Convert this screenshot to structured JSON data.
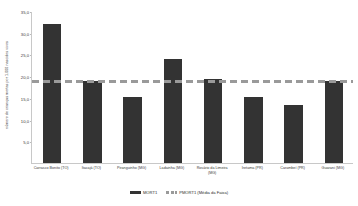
{
  "chart_data": {
    "type": "bar",
    "title": "",
    "xlabel": "",
    "ylabel": "número de crianças mortas por 1.000 nascidos vivos",
    "ylim": [
      0,
      35
    ],
    "yticks": [
      "5,0",
      "10,0",
      "15,0",
      "20,0",
      "25,0",
      "30,0",
      "35,0"
    ],
    "ytick_values": [
      5,
      10,
      15,
      20,
      25,
      30,
      35
    ],
    "grid": false,
    "legend_position": "bottom",
    "categories": [
      "Carrasco Bonito (TO)",
      "Itacajá (TO)",
      "Piranguinho (MG)",
      "Ladainha (MG)",
      "Rosário da Limeira (MG)",
      "Iretama (PR)",
      "Carambeí (PR)",
      "Guarani (MG)"
    ],
    "series": [
      {
        "name": "MORT1",
        "type": "bar",
        "color": "#333333",
        "values": [
          32.0,
          19.0,
          15.2,
          24.0,
          19.3,
          15.2,
          13.3,
          18.8
        ]
      },
      {
        "name": "PMORT1 (Média da Faixa)",
        "type": "line",
        "style": "dashed",
        "color": "#9a9a9a",
        "constant_value": 19.0,
        "values": [
          19.0,
          19.0,
          19.0,
          19.0,
          19.0,
          19.0,
          19.0,
          19.0
        ]
      }
    ]
  },
  "legend": {
    "items": [
      {
        "label": "MORT1"
      },
      {
        "label": "PMORT1 (Média da Faixa)"
      }
    ]
  },
  "colors": {
    "bar": "#333333",
    "average_line": "#9a9a9a",
    "axis": "#c8c8c8",
    "text": "#3a3a3a",
    "background": "#ffffff"
  }
}
